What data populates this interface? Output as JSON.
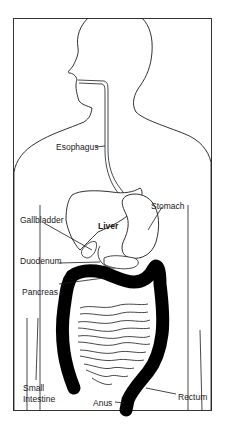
{
  "diagram": {
    "labels": {
      "esophagus": "Esophagus",
      "stomach": "Stomach",
      "gallbladder": "Gallbladder",
      "liver": "Liver",
      "duodenum": "Duodenum",
      "pancreas": "Pancreas",
      "small_intestine_1": "Small",
      "small_intestine_2": "Intestine",
      "anus": "Anus",
      "rectum": "Rectum"
    },
    "colors": {
      "line": "#1a1a1a",
      "colon_fill": "#000000",
      "background": "#ffffff"
    }
  }
}
